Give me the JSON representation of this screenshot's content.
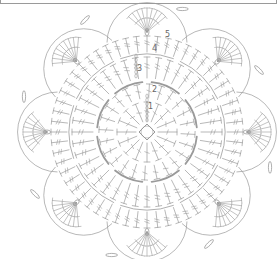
{
  "diagram": {
    "type": "crochet-chart",
    "line_color": "#9a9a9a",
    "background": "#ffffff",
    "center": [
      147,
      132
    ],
    "rounds": [
      {
        "label": "1",
        "pos": [
          148,
          103
        ]
      },
      {
        "label": "2",
        "pos": [
          152,
          86
        ]
      },
      {
        "label": "3",
        "pos": [
          137,
          65
        ]
      },
      {
        "label": "4",
        "pos": [
          152,
          45
        ]
      },
      {
        "label": "5",
        "pos": [
          165,
          31
        ]
      }
    ],
    "petals": 8
  }
}
